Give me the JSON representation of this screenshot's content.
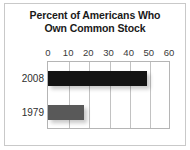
{
  "chart_data": {
    "type": "bar",
    "orientation": "horizontal",
    "title": "Percent of Americans Who Own Common Stock",
    "title_lines": [
      "Percent of Americans Who",
      "Own Common Stock"
    ],
    "categories": [
      "2008",
      "1979"
    ],
    "values": [
      49,
      18
    ],
    "series": [
      {
        "name": "Percent owning common stock",
        "values": [
          49,
          18
        ],
        "colors": [
          "#141414",
          "#595959"
        ]
      }
    ],
    "xlabel": "",
    "ylabel": "",
    "xlim": [
      0,
      60
    ],
    "xticks": [
      0,
      10,
      20,
      30,
      40,
      50,
      60
    ],
    "xtick_labels": [
      "0",
      "10",
      "20",
      "30",
      "40",
      "50",
      "60"
    ],
    "grid": "vertical",
    "legend": "none",
    "bar_colors": {
      "2008": "#141414",
      "1979": "#595959"
    },
    "frame_color": "#b5b5b5",
    "gridline_color": "#c2c2c2",
    "background": "#ffffff"
  }
}
